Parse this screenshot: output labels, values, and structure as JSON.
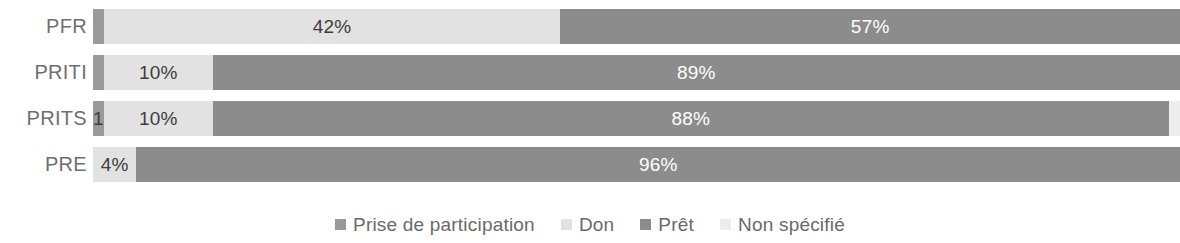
{
  "chart_data": {
    "type": "bar",
    "subtype": "stacked-horizontal-100",
    "title": "",
    "xlabel": "",
    "ylabel": "",
    "xlim": [
      0,
      100
    ],
    "grid": false,
    "legend_position": "bottom",
    "categories": [
      "PFR",
      "PRITI",
      "PRITS",
      "PRE"
    ],
    "series": [
      {
        "name": "Prise de participation",
        "color": "#9a9a9a",
        "values": [
          1,
          1,
          1,
          0
        ]
      },
      {
        "name": "Don",
        "color": "#e2e2e2",
        "values": [
          42,
          10,
          10,
          4
        ]
      },
      {
        "name": "Prêt",
        "color": "#8c8c8c",
        "values": [
          57,
          89,
          88,
          96
        ]
      },
      {
        "name": "Non spécifié",
        "color": "#ededed",
        "values": [
          0,
          0,
          1,
          0
        ]
      }
    ],
    "bars": [
      {
        "category": "PFR",
        "segments": [
          {
            "series": "Prise de participation",
            "value": 1,
            "label": "",
            "label_color": ""
          },
          {
            "series": "Don",
            "value": 42,
            "label": "42%",
            "label_color": "#3d3d3d"
          },
          {
            "series": "Prêt",
            "value": 57,
            "label": "57%",
            "label_color": "#ffffff"
          }
        ]
      },
      {
        "category": "PRITI",
        "segments": [
          {
            "series": "Prise de participation",
            "value": 1,
            "label": "",
            "label_color": ""
          },
          {
            "series": "Don",
            "value": 10,
            "label": "10%",
            "label_color": "#3d3d3d"
          },
          {
            "series": "Prêt",
            "value": 89,
            "label": "89%",
            "label_color": "#ffffff"
          }
        ]
      },
      {
        "category": "PRITS",
        "segments": [
          {
            "series": "Prise de participation",
            "value": 1,
            "label": "1%",
            "label_color": "#3d3d3d"
          },
          {
            "series": "Don",
            "value": 10,
            "label": "10%",
            "label_color": "#3d3d3d"
          },
          {
            "series": "Prêt",
            "value": 88,
            "label": "88%",
            "label_color": "#ffffff"
          },
          {
            "series": "Non spécifié",
            "value": 1,
            "label": "",
            "label_color": ""
          }
        ]
      },
      {
        "category": "PRE",
        "segments": [
          {
            "series": "Don",
            "value": 4,
            "label": "4%",
            "label_color": "#3d3d3d"
          },
          {
            "series": "Prêt",
            "value": 96,
            "label": "96%",
            "label_color": "#ffffff"
          }
        ]
      }
    ],
    "legend": [
      {
        "label": "Prise de participation",
        "color": "#9a9a9a"
      },
      {
        "label": "Don",
        "color": "#e2e2e2"
      },
      {
        "label": "Prêt",
        "color": "#8c8c8c"
      },
      {
        "label": "Non spécifié",
        "color": "#ededed"
      }
    ]
  },
  "colors": {
    "prise_de_participation": "#9a9a9a",
    "don": "#e2e2e2",
    "pret": "#8c8c8c",
    "non_specifie": "#ededed",
    "label_text": "#6f6f6f",
    "value_dark": "#3d3d3d",
    "value_light": "#ffffff",
    "background": "#ffffff"
  }
}
